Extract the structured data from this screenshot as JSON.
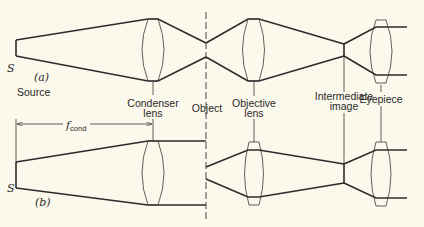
{
  "diagram": {
    "panels": [
      {
        "id": "a",
        "label": "(a)",
        "description": "Critical illumination: source imaged onto object"
      },
      {
        "id": "b",
        "label": "(b)",
        "description": "Köhler illumination: source at condenser focal length"
      }
    ],
    "labels": {
      "source_symbol": "S",
      "source": "Source",
      "condenser_line1": "Condenser",
      "condenser_line2": "lens",
      "object": "Object",
      "objective_line1": "Objective",
      "objective_line2": "lens",
      "intermediate_line1": "Intermediate",
      "intermediate_line2": "image",
      "eyepiece": "Eyepiece",
      "fcond_main": "f",
      "fcond_sub": "cond",
      "panel_a": "(a)",
      "panel_b": "(b)"
    },
    "colors": {
      "background": "#fbf8ec",
      "line": "#2b2b2b"
    }
  }
}
